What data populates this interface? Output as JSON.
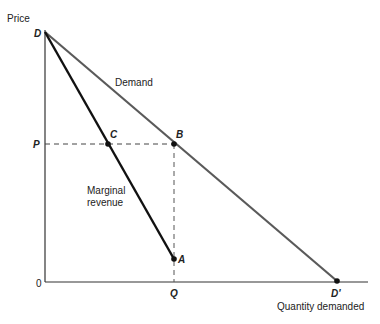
{
  "diagram": {
    "axis_labels": {
      "y": "Price",
      "x": "Quantity demanded",
      "origin": "0"
    },
    "curves": [
      {
        "id": "demand",
        "label": "Demand",
        "from": "D",
        "to": "D'",
        "color": "#555555"
      },
      {
        "id": "mr",
        "label_line1": "Marginal",
        "label_line2": "revenue",
        "from": "D",
        "to": "A",
        "color": "#111111"
      }
    ],
    "points": {
      "D": "D",
      "B": "B",
      "C": "C",
      "A": "A",
      "D_prime": "D'",
      "P": "P",
      "Q": "Q"
    },
    "guides": [
      {
        "from": "P",
        "to": "B",
        "style": "dashed"
      },
      {
        "from": "B",
        "to": "Q",
        "style": "dashed"
      }
    ]
  }
}
